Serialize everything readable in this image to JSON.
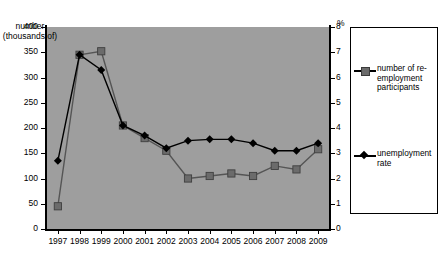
{
  "chart_data": {
    "type": "line",
    "title": "",
    "xlabel": "",
    "ylabel": "number (thousands of)",
    "y2label": "%",
    "categories": [
      "1997",
      "1998",
      "1999",
      "2000",
      "2001",
      "2002",
      "2003",
      "2004",
      "2005",
      "2006",
      "2007",
      "2008",
      "2009"
    ],
    "ylim": [
      0,
      400
    ],
    "y2lim": [
      0,
      8
    ],
    "yticks": [
      "0",
      "50",
      "100",
      "150",
      "200",
      "250",
      "300",
      "350",
      "400"
    ],
    "y2ticks": [
      "0",
      "1",
      "2",
      "3",
      "4",
      "5",
      "6",
      "7",
      "8"
    ],
    "grid": false,
    "legend_position": "right",
    "series": [
      {
        "name": "number of re-employment participants",
        "axis": "left",
        "marker": "square",
        "color": "#6b6b6b",
        "values": [
          45,
          345,
          352,
          205,
          180,
          155,
          100,
          105,
          110,
          105,
          125,
          118,
          158
        ]
      },
      {
        "name": "unemployment rate",
        "axis": "right",
        "marker": "diamond",
        "color": "#000000",
        "values": [
          2.7,
          6.9,
          6.3,
          4.1,
          3.7,
          3.2,
          3.5,
          3.55,
          3.55,
          3.4,
          3.1,
          3.1,
          3.4
        ]
      }
    ]
  },
  "axis": {
    "left_caption": "number (thousands of)",
    "right_caption": "%"
  },
  "legend": {
    "items": [
      {
        "label": "number of re-employment participants",
        "marker": "square-icon"
      },
      {
        "label": "unemployment rate",
        "marker": "diamond-icon"
      }
    ]
  }
}
